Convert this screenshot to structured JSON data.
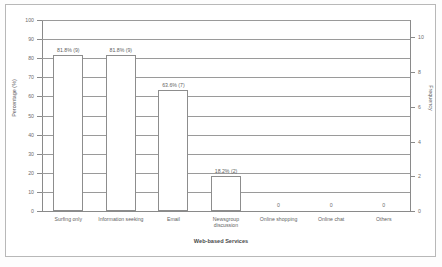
{
  "chart_data": {
    "type": "bar",
    "title": "",
    "xlabel": "Web-based Services",
    "ylabel": "Percentage (%)",
    "ylabel_right": "Frequency",
    "categories": [
      "Surfing only",
      "Information seeking",
      "Email",
      "Newsgroup\ndiscussion",
      "Online shopping",
      "Online chat",
      "Others"
    ],
    "values": [
      81.8,
      81.8,
      63.6,
      18.2,
      0,
      0,
      0
    ],
    "frequencies": [
      9,
      9,
      7,
      2,
      0,
      0,
      0
    ],
    "data_labels": [
      "81.8% (9)",
      "81.8% (9)",
      "63.6% (7)",
      "18.2% (2)",
      "0",
      "0",
      "0"
    ],
    "ylim": [
      0,
      100
    ],
    "yticks": [
      0,
      10,
      20,
      30,
      40,
      50,
      60,
      70,
      80,
      90,
      100
    ],
    "ytick_labels": [
      "0",
      "10",
      "20",
      "30",
      "40",
      "50",
      "60",
      "70",
      "80",
      "90",
      "100"
    ],
    "ylim_right": [
      0,
      11
    ],
    "yticks_right": [
      0,
      2,
      4,
      6,
      8,
      10
    ],
    "ytick_labels_right": [
      "0",
      "2",
      "4",
      "6",
      "8",
      "10"
    ],
    "grid": true,
    "legend": false,
    "bar_fill": "#ffffff",
    "bar_edge": "#8d8d8d",
    "grid_color": "#9a9a9a",
    "text_color": "#5f5f5f",
    "background": "#ffffff"
  }
}
